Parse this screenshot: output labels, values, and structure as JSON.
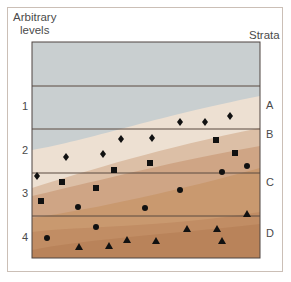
{
  "figure": {
    "left_title_line1": "Arbitrary",
    "left_title_line2": "levels",
    "right_title": "Strata",
    "levels": [
      {
        "label": "1",
        "top": 100
      },
      {
        "label": "2",
        "top": 144
      },
      {
        "label": "3",
        "top": 187
      },
      {
        "label": "4",
        "top": 231
      }
    ],
    "strata": [
      {
        "label": "A",
        "top": 99
      },
      {
        "label": "B",
        "top": 128
      },
      {
        "label": "C",
        "top": 176
      },
      {
        "label": "D",
        "top": 227
      }
    ],
    "colors": {
      "sky": "#c9cfd0",
      "stratum_a": "#c3ccd0",
      "stratum_b": "#ede0d2",
      "stratum_c_light": "#dcbfa6",
      "stratum_c": "#cfa585",
      "stratum_d_light": "#c79670",
      "stratum_d": "#b9835a",
      "lines": "#5a4a40",
      "markers": "#111111"
    }
  },
  "chart_data": {
    "type": "scatter",
    "title": "",
    "xlabel": "",
    "ylabel": "Arbitrary levels",
    "secondary_ylabel": "Strata",
    "level_labels": [
      "1",
      "2",
      "3",
      "4"
    ],
    "strata_labels": [
      "A",
      "B",
      "C",
      "D"
    ],
    "grid": "horizontal lines at arbitrary level boundaries",
    "series": [
      {
        "name": "diamond",
        "marker": "diamond",
        "points": [
          [
            37,
            176
          ],
          [
            66,
            157
          ],
          [
            103,
            154
          ],
          [
            121,
            139
          ],
          [
            152,
            138
          ],
          [
            180,
            122
          ],
          [
            205,
            122
          ],
          [
            230,
            116
          ]
        ]
      },
      {
        "name": "square",
        "marker": "square",
        "points": [
          [
            62,
            182
          ],
          [
            41,
            201
          ],
          [
            96,
            188
          ],
          [
            114,
            170
          ],
          [
            150,
            163
          ],
          [
            216,
            140
          ],
          [
            235,
            153
          ]
        ]
      },
      {
        "name": "circle",
        "marker": "circle",
        "points": [
          [
            78,
            207
          ],
          [
            145,
            208
          ],
          [
            180,
            190
          ],
          [
            222,
            172
          ],
          [
            247,
            166
          ],
          [
            47,
            238
          ],
          [
            96,
            227
          ]
        ]
      },
      {
        "name": "triangle",
        "marker": "triangle",
        "points": [
          [
            79,
            247
          ],
          [
            109,
            246
          ],
          [
            127,
            240
          ],
          [
            156,
            241
          ],
          [
            187,
            229
          ],
          [
            217,
            229
          ],
          [
            222,
            241
          ],
          [
            247,
            214
          ]
        ]
      }
    ]
  }
}
